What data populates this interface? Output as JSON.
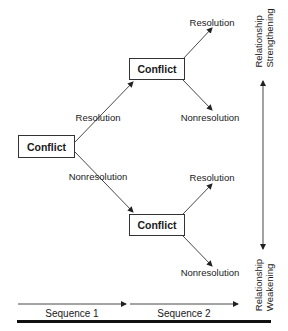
{
  "diagram": {
    "nodes": [
      {
        "id": "root",
        "label": "Conflict"
      },
      {
        "id": "upper",
        "label": "Conflict"
      },
      {
        "id": "lower",
        "label": "Conflict"
      }
    ],
    "edges": {
      "root_to_upper": "Resolution",
      "root_to_lower": "Nonresolution",
      "upper_resolution": "Resolution",
      "upper_nonresolution": "Nonresolution",
      "lower_resolution": "Resolution",
      "lower_nonresolution": "Nonresolution"
    },
    "axis": {
      "top_label_line1": "Relationship",
      "top_label_line2": "Strengthening",
      "bottom_label_line1": "Relationship",
      "bottom_label_line2": "Weakening"
    },
    "sequences": [
      "Sequence 1",
      "Sequence 2"
    ],
    "colors": {
      "line": "#333333",
      "rule": "#111111"
    }
  }
}
